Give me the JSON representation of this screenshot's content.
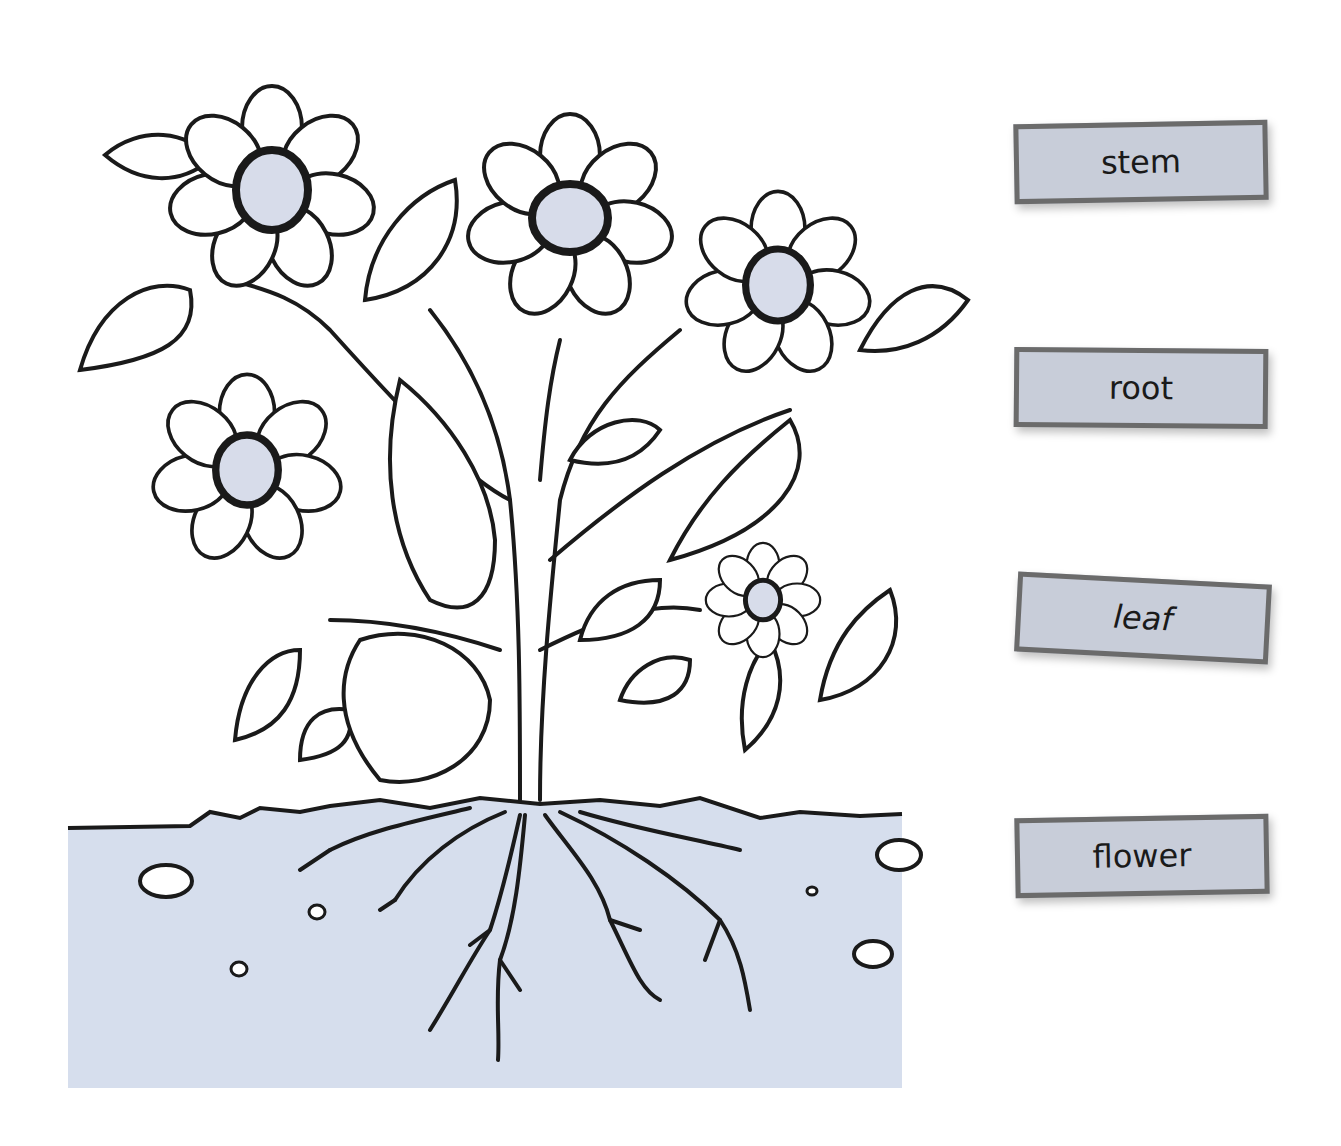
{
  "worksheet": {
    "topic": "parts of a plant",
    "labels": [
      {
        "id": "stem",
        "text": "stem"
      },
      {
        "id": "root",
        "text": "root"
      },
      {
        "id": "leaf",
        "text": "leaf"
      },
      {
        "id": "flower",
        "text": "flower"
      }
    ]
  },
  "colors": {
    "soil": "#d6deed",
    "flower_center": "#d7dcea",
    "outline": "#1a1a1a",
    "card_fill": "#c8cdd9",
    "card_border": "#6b6b6b"
  }
}
